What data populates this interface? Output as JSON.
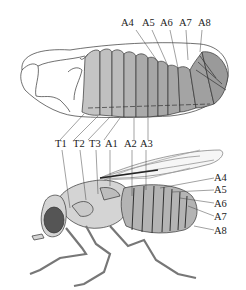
{
  "figure": {
    "embryo": {
      "top_labels": [
        "A4",
        "A5",
        "A6",
        "A7",
        "A8"
      ],
      "bottom_labels": [
        "T1",
        "T2",
        "T3",
        "A1",
        "A2",
        "A3"
      ]
    },
    "adult": {
      "top_labels": [
        "T1",
        "T2",
        "T3",
        "A1",
        "A2",
        "A3"
      ],
      "right_labels": [
        "A4",
        "A5",
        "A6",
        "A7",
        "A8"
      ]
    },
    "colors": {
      "outline": "#333333",
      "segment_light": "#c8c8c8",
      "segment_mid": "#a9a9a9",
      "segment_dark": "#969696",
      "eye": "#555555",
      "body": "#d4d4d4"
    }
  }
}
